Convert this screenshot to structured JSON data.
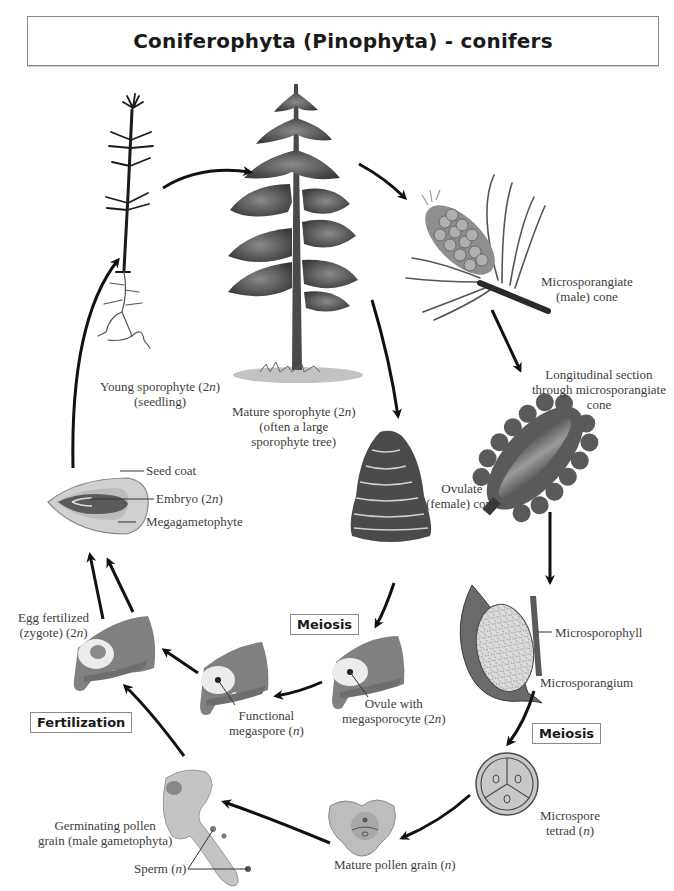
{
  "title": "Coniferophyta (Pinophyta) - conifers",
  "stage_boxes": {
    "meiosis_female": "Meiosis",
    "meiosis_male": "Meiosis",
    "fertilization": "Fertilization"
  },
  "labels": {
    "young_sporophyte": [
      "Young sporophyte (2n)",
      "(seedling)"
    ],
    "mature_sporophyte": [
      "Mature sporophyte (2n)",
      "(often a large",
      "sporophyte tree)"
    ],
    "microsporangiate_cone": [
      "Microsporangiate",
      "(male) cone"
    ],
    "longitudinal_section": [
      "Longitudinal section",
      "through microsporangiate",
      "cone"
    ],
    "ovulate_cone": [
      "Ovulate",
      "(female) cone"
    ],
    "microsporophyll": "Microsporophyll",
    "microsporangium": "Microsporangium",
    "microspore_tetrad": [
      "Microspore",
      "tetrad (n)"
    ],
    "mature_pollen_grain": "Mature pollen grain (n)",
    "germinating_pollen": [
      "Germinating pollen",
      "grain (male gametophyta)"
    ],
    "sperm": "Sperm (n)",
    "ovule_megasporocyte": [
      "Ovule with",
      "megasporocyte (2n)"
    ],
    "functional_megaspore": [
      "Functional",
      "megaspore (n)"
    ],
    "egg_fertilized": [
      "Egg fertilized",
      "(zygote) (2n)"
    ],
    "seed_coat": "Seed coat",
    "embryo": "Embryo (2n)",
    "megagametophyte": "Megagametophyte"
  },
  "colors": {
    "arrow": "#111111",
    "tissue": "#7d7d7d",
    "tissue_light": "#e6e6e6",
    "foliage": "#4a4a4a",
    "border": "#8a8a8a"
  }
}
